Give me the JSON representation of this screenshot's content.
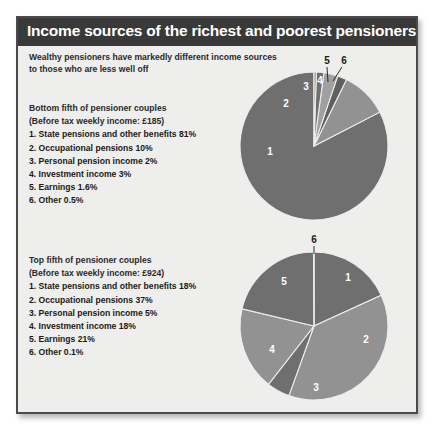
{
  "header": {
    "title": "Income sources of the richest and poorest pensioners"
  },
  "subtitle": {
    "line1": "Wealthy pensioners have markedly different income sources",
    "line2": "to those who are less well off"
  },
  "blocks": {
    "bottom": {
      "heading": "Bottom fifth of pensioner couples",
      "income_note": "(Before tax weekly income: £185)",
      "items": [
        "1. State pensions and other benefits 81%",
        "2. Occupational pensions 10%",
        "3. Personal pension income 2%",
        "4. Investment income 3%",
        "5. Earnings 1.6%",
        "6. Other 0.5%"
      ],
      "slice_labels": [
        "1",
        "2",
        "3",
        "4",
        "5",
        "6"
      ]
    },
    "top": {
      "heading": "Top fifth of pensioner couples",
      "income_note": "(Before tax weekly income: £924)",
      "items": [
        "1. State pensions and other benefits 18%",
        "2. Occupational pensions 37%",
        "3. Personal pension income 5%",
        "4. Investment income 18%",
        "5. Earnings 21%",
        "6. Other 0.1%"
      ],
      "slice_labels": [
        "1",
        "2",
        "3",
        "4",
        "5",
        "6"
      ]
    }
  },
  "colors": {
    "header_bar": "#393939",
    "panel_background": "#eeeeec",
    "panel_border": "#4a4a4a",
    "slice_dark": "#6f6f6f",
    "slice_light": "#929292",
    "slice_separator": "#eeeeec",
    "label_text": "#1a1a1a"
  },
  "chart_data": [
    {
      "type": "pie",
      "title": "Bottom fifth of pensioner couples",
      "subtitle": "(Before tax weekly income: £185)",
      "categories": [
        "State pensions and other benefits",
        "Occupational pensions",
        "Personal pension income",
        "Investment income",
        "Earnings",
        "Other"
      ],
      "values": [
        81,
        10,
        2,
        3,
        1.6,
        0.5
      ],
      "unit": "%",
      "slice_colors": [
        "#6f6f6f",
        "#929292",
        "#5f5f5f",
        "#a0a0a0",
        "#6f6f6f",
        "#929292"
      ],
      "legend_position": "left",
      "start_angle_deg": 0,
      "direction": "counterclockwise"
    },
    {
      "type": "pie",
      "title": "Top fifth of pensioner couples",
      "subtitle": "(Before tax weekly income: £924)",
      "categories": [
        "State pensions and other benefits",
        "Occupational pensions",
        "Personal pension income",
        "Investment income",
        "Earnings",
        "Other"
      ],
      "values": [
        18,
        37,
        5,
        18,
        21,
        0.1
      ],
      "unit": "%",
      "slice_colors": [
        "#6f6f6f",
        "#929292",
        "#6f6f6f",
        "#929292",
        "#6f6f6f",
        "#929292"
      ],
      "legend_position": "left",
      "start_angle_deg": 0,
      "direction": "clockwise"
    }
  ]
}
